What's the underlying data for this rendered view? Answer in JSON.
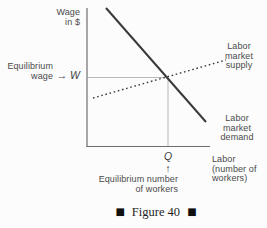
{
  "colors": {
    "axis": "#6e6e6e",
    "curve": "#3a3a3a",
    "guide": "#b8b8b8",
    "text": "#4a4a4a",
    "caption_text": "#1f1f1f"
  },
  "diagram": {
    "y_axis_label": {
      "line1": "Wage",
      "line2": "in $"
    },
    "x_axis_label": {
      "line1": "Labor",
      "line2": "(number of",
      "line3": "workers)"
    },
    "equilibrium_wage": {
      "line1": "Equilibrium",
      "line2": "wage",
      "arrow": "→",
      "symbol": "W"
    },
    "equilibrium_quantity": {
      "symbol": "Q",
      "arrow": "↑",
      "line1": "Equilibrium number",
      "line2": "of workers"
    },
    "supply_label": {
      "line1": "Labor",
      "line2": "market",
      "line3": "supply"
    },
    "demand_label": {
      "line1": "Labor",
      "line2": "market",
      "line3": "demand"
    },
    "curves": [
      {
        "name": "Labor market demand",
        "style": "solid",
        "direction": "downward-sloping"
      },
      {
        "name": "Labor market supply",
        "style": "dotted",
        "direction": "upward-sloping"
      }
    ]
  },
  "caption": {
    "marker_left": "■",
    "text": "Figure 40",
    "marker_right": "■"
  }
}
